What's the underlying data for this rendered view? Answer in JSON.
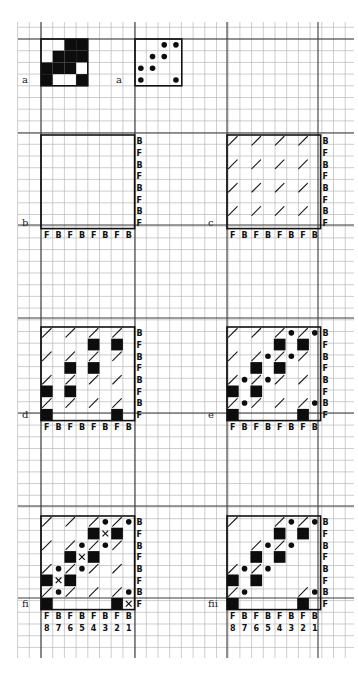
{
  "grid": {
    "x0": 18,
    "y0": 22,
    "x1": 354,
    "y1": 658,
    "cell": 11.7,
    "major_x": [
      41,
      135,
      227,
      318
    ],
    "major_y": [
      39,
      133,
      225,
      318,
      413,
      506,
      598
    ]
  },
  "panels": [
    {
      "id": "a-weave",
      "tag": "a",
      "x": 41,
      "y": 39,
      "cols": 4,
      "rows": 4,
      "frame": true,
      "black": [
        [
          0,
          2
        ],
        [
          0,
          3
        ],
        [
          1,
          1
        ],
        [
          1,
          2
        ],
        [
          1,
          3
        ],
        [
          2,
          0
        ],
        [
          2,
          1
        ],
        [
          2,
          2
        ],
        [
          3,
          0
        ],
        [
          3,
          3
        ]
      ],
      "dots": [],
      "slashes": [],
      "xs": [],
      "right_labels": [],
      "bottom_labels": [],
      "number_labels": []
    },
    {
      "id": "a-dots",
      "tag": "a",
      "x": 135,
      "y": 39,
      "cols": 4,
      "rows": 4,
      "frame": true,
      "black": [],
      "dots": [
        [
          0,
          2
        ],
        [
          0,
          3
        ],
        [
          1,
          1
        ],
        [
          1,
          2
        ],
        [
          2,
          0
        ],
        [
          2,
          1
        ],
        [
          3,
          0
        ],
        [
          3,
          3
        ]
      ],
      "slashes": [],
      "xs": [],
      "right_labels": [],
      "bottom_labels": [],
      "number_labels": []
    },
    {
      "id": "b",
      "tag": "b",
      "x": 41,
      "y": 135,
      "cols": 8,
      "rows": 8,
      "frame": true,
      "black": [],
      "dots": [],
      "slashes": [],
      "xs": [],
      "right_labels": [
        "B",
        "F",
        "B",
        "F",
        "B",
        "F",
        "B",
        "F"
      ],
      "bottom_labels": [
        "F",
        "B",
        "F",
        "B",
        "F",
        "B",
        "F",
        "B"
      ],
      "number_labels": []
    },
    {
      "id": "c",
      "tag": "c",
      "x": 227,
      "y": 135,
      "cols": 8,
      "rows": 8,
      "frame": true,
      "black": [],
      "dots": [],
      "xs": [],
      "slashes": [
        [
          0,
          0
        ],
        [
          0,
          2
        ],
        [
          0,
          4
        ],
        [
          0,
          6
        ],
        [
          2,
          0
        ],
        [
          2,
          2
        ],
        [
          2,
          4
        ],
        [
          2,
          6
        ],
        [
          4,
          0
        ],
        [
          4,
          2
        ],
        [
          4,
          4
        ],
        [
          4,
          6
        ],
        [
          6,
          0
        ],
        [
          6,
          2
        ],
        [
          6,
          4
        ],
        [
          6,
          6
        ]
      ],
      "right_labels": [
        "B",
        "F",
        "B",
        "F",
        "B",
        "F",
        "B",
        "F"
      ],
      "bottom_labels": [
        "F",
        "B",
        "F",
        "B",
        "F",
        "B",
        "F",
        "B"
      ],
      "number_labels": []
    },
    {
      "id": "d",
      "tag": "d",
      "x": 41,
      "y": 327,
      "cols": 8,
      "rows": 8,
      "frame": true,
      "black": [
        [
          1,
          4
        ],
        [
          1,
          6
        ],
        [
          3,
          2
        ],
        [
          3,
          4
        ],
        [
          5,
          0
        ],
        [
          5,
          2
        ],
        [
          7,
          0
        ],
        [
          7,
          6
        ]
      ],
      "dots": [],
      "xs": [],
      "slashes": [
        [
          0,
          0
        ],
        [
          0,
          2
        ],
        [
          0,
          4
        ],
        [
          0,
          6
        ],
        [
          2,
          0
        ],
        [
          2,
          2
        ],
        [
          2,
          4
        ],
        [
          2,
          6
        ],
        [
          4,
          0
        ],
        [
          4,
          2
        ],
        [
          4,
          4
        ],
        [
          4,
          6
        ],
        [
          6,
          0
        ],
        [
          6,
          2
        ],
        [
          6,
          4
        ],
        [
          6,
          6
        ]
      ],
      "right_labels": [
        "B",
        "F",
        "B",
        "F",
        "B",
        "F",
        "B",
        "F"
      ],
      "bottom_labels": [
        "F",
        "B",
        "F",
        "B",
        "F",
        "B",
        "F",
        "B"
      ],
      "number_labels": []
    },
    {
      "id": "e",
      "tag": "e",
      "x": 227,
      "y": 327,
      "cols": 8,
      "rows": 8,
      "frame": true,
      "black": [
        [
          1,
          4
        ],
        [
          1,
          6
        ],
        [
          3,
          2
        ],
        [
          3,
          4
        ],
        [
          5,
          0
        ],
        [
          5,
          2
        ],
        [
          7,
          0
        ],
        [
          7,
          6
        ]
      ],
      "dots": [
        [
          0,
          5
        ],
        [
          0,
          7
        ],
        [
          2,
          3
        ],
        [
          2,
          5
        ],
        [
          4,
          1
        ],
        [
          4,
          3
        ],
        [
          6,
          1
        ],
        [
          6,
          7
        ]
      ],
      "xs": [],
      "slashes": [
        [
          0,
          0
        ],
        [
          0,
          2
        ],
        [
          0,
          4
        ],
        [
          0,
          6
        ],
        [
          2,
          0
        ],
        [
          2,
          2
        ],
        [
          2,
          4
        ],
        [
          2,
          6
        ],
        [
          4,
          0
        ],
        [
          4,
          2
        ],
        [
          4,
          4
        ],
        [
          4,
          6
        ],
        [
          6,
          0
        ],
        [
          6,
          2
        ],
        [
          6,
          4
        ],
        [
          6,
          6
        ]
      ],
      "right_labels": [
        "B",
        "F",
        "B",
        "F",
        "B",
        "F",
        "B",
        "F"
      ],
      "bottom_labels": [
        "F",
        "B",
        "F",
        "B",
        "F",
        "B",
        "F",
        "B"
      ],
      "number_labels": []
    },
    {
      "id": "fi",
      "tag": "fi",
      "x": 41,
      "y": 516,
      "cols": 8,
      "rows": 8,
      "frame": true,
      "black": [
        [
          1,
          4
        ],
        [
          1,
          6
        ],
        [
          3,
          2
        ],
        [
          3,
          4
        ],
        [
          5,
          0
        ],
        [
          5,
          2
        ],
        [
          7,
          0
        ],
        [
          7,
          6
        ]
      ],
      "dots": [
        [
          0,
          5
        ],
        [
          0,
          7
        ],
        [
          2,
          3
        ],
        [
          2,
          5
        ],
        [
          4,
          1
        ],
        [
          4,
          3
        ],
        [
          6,
          1
        ],
        [
          6,
          7
        ]
      ],
      "xs": [
        [
          1,
          5
        ],
        [
          3,
          3
        ],
        [
          5,
          1
        ],
        [
          7,
          7
        ]
      ],
      "slashes": [
        [
          0,
          0
        ],
        [
          0,
          2
        ],
        [
          0,
          4
        ],
        [
          0,
          6
        ],
        [
          2,
          0
        ],
        [
          2,
          2
        ],
        [
          2,
          4
        ],
        [
          2,
          6
        ],
        [
          4,
          0
        ],
        [
          4,
          2
        ],
        [
          4,
          4
        ],
        [
          4,
          6
        ],
        [
          6,
          0
        ],
        [
          6,
          2
        ],
        [
          6,
          4
        ],
        [
          6,
          6
        ]
      ],
      "right_labels": [
        "B",
        "F",
        "B",
        "F",
        "B",
        "F",
        "B",
        "F"
      ],
      "bottom_labels": [
        "F",
        "B",
        "F",
        "B",
        "F",
        "B",
        "F",
        "B"
      ],
      "number_labels": [
        "8",
        "7",
        "6",
        "5",
        "4",
        "3",
        "2",
        "1"
      ]
    },
    {
      "id": "fii",
      "tag": "fii",
      "x": 227,
      "y": 516,
      "cols": 8,
      "rows": 8,
      "frame": true,
      "black": [
        [
          1,
          4
        ],
        [
          1,
          6
        ],
        [
          3,
          2
        ],
        [
          3,
          4
        ],
        [
          5,
          0
        ],
        [
          5,
          2
        ],
        [
          7,
          0
        ],
        [
          7,
          6
        ]
      ],
      "dots": [
        [
          0,
          5
        ],
        [
          0,
          7
        ],
        [
          2,
          3
        ],
        [
          2,
          5
        ],
        [
          4,
          1
        ],
        [
          4,
          3
        ],
        [
          6,
          1
        ],
        [
          6,
          7
        ]
      ],
      "xs": [],
      "slashes": [
        [
          0,
          0
        ],
        [
          0,
          4
        ],
        [
          0,
          6
        ],
        [
          2,
          2
        ],
        [
          2,
          4
        ],
        [
          4,
          0
        ],
        [
          4,
          2
        ],
        [
          6,
          0
        ],
        [
          6,
          6
        ]
      ],
      "right_labels": [
        "B",
        "F",
        "B",
        "F",
        "B",
        "F",
        "B",
        "F"
      ],
      "bottom_labels": [
        "F",
        "B",
        "F",
        "B",
        "F",
        "B",
        "F",
        "B"
      ],
      "number_labels": [
        "8",
        "7",
        "6",
        "5",
        "4",
        "3",
        "2",
        "1"
      ]
    }
  ]
}
